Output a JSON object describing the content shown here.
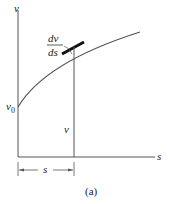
{
  "figure": {
    "caption": "(a)",
    "axes": {
      "y_label": "v",
      "x_label": "s"
    },
    "labels": {
      "initial_value": "v",
      "initial_value_subscript": "0",
      "ordinate": "v",
      "slope_numerator": "dv",
      "slope_denominator": "ds",
      "dimension": "s"
    },
    "colors": {
      "line": "#333333",
      "curve": "#555555",
      "tangent": "#111111"
    }
  }
}
